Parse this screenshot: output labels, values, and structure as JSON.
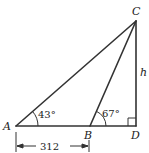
{
  "diagram": {
    "type": "triangle-geometry",
    "points": {
      "A": {
        "label": "A",
        "x": 16,
        "y": 126
      },
      "B": {
        "label": "B",
        "x": 90,
        "y": 126
      },
      "C": {
        "label": "C",
        "x": 136,
        "y": 21
      },
      "D": {
        "label": "D",
        "x": 136,
        "y": 126
      }
    },
    "segments": [
      "AC",
      "BC",
      "CD",
      "AD"
    ],
    "angles": {
      "A": "43°",
      "B": "67°",
      "D": "right-angle"
    },
    "side_labels": {
      "CD": "h",
      "AB": "312"
    },
    "line_color": "#333333"
  }
}
